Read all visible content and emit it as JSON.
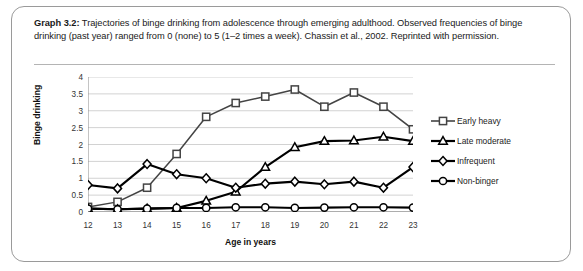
{
  "figure": {
    "caption_label": "Graph 3.2:",
    "caption_text": " Trajectories of binge drinking from adolescence through emerging adulthood. Observed frequencies of binge drinking (past year) ranged from 0 (none) to 5 (1–2 times a week). Chassin et al., 2002. Reprinted with permission."
  },
  "chart_data": {
    "type": "line",
    "title": "",
    "xlabel": "Age in years",
    "ylabel": "Binge drinking",
    "categories": [
      "12",
      "13",
      "14",
      "15",
      "16",
      "17",
      "18",
      "19",
      "20",
      "21",
      "22",
      "23"
    ],
    "x": [
      12,
      13,
      14,
      15,
      16,
      17,
      18,
      19,
      20,
      21,
      22,
      23
    ],
    "xlim": [
      12,
      23
    ],
    "ylim": [
      0,
      4
    ],
    "yticks": [
      "0",
      "0.5",
      "1",
      "1.5",
      "2",
      "2.5",
      "3",
      "3.5",
      "4"
    ],
    "ytick_values": [
      0,
      0.5,
      1,
      1.5,
      2,
      2.5,
      3,
      3.5,
      4
    ],
    "grid": "horizontal",
    "legend_position": "right",
    "series": [
      {
        "name": "Early heavy",
        "marker": "square",
        "color": "#444444",
        "values": [
          0.15,
          0.3,
          0.72,
          1.72,
          2.82,
          3.23,
          3.42,
          3.63,
          3.12,
          3.54,
          3.12,
          2.45
        ]
      },
      {
        "name": "Late moderate",
        "marker": "triangle",
        "color": "#000000",
        "values": [
          0.1,
          0.08,
          0.1,
          0.12,
          0.33,
          0.6,
          1.33,
          1.92,
          2.1,
          2.12,
          2.23,
          2.1
        ]
      },
      {
        "name": "Infrequent",
        "marker": "diamond",
        "color": "#000000",
        "values": [
          0.8,
          0.7,
          1.42,
          1.12,
          1.0,
          0.72,
          0.84,
          0.9,
          0.82,
          0.9,
          0.72,
          1.33
        ]
      },
      {
        "name": "Non-binger",
        "marker": "circle",
        "color": "#000000",
        "values": [
          0.1,
          0.08,
          0.1,
          0.12,
          0.12,
          0.14,
          0.14,
          0.12,
          0.13,
          0.14,
          0.14,
          0.13
        ]
      }
    ]
  },
  "legend": {
    "items": [
      {
        "label": "Early heavy",
        "marker": "square"
      },
      {
        "label": "Late moderate",
        "marker": "triangle"
      },
      {
        "label": "Infrequent",
        "marker": "diamond"
      },
      {
        "label": "Non-binger",
        "marker": "circle"
      }
    ]
  }
}
